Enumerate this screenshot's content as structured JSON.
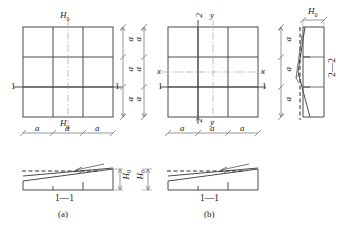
{
  "figure": {
    "title": "",
    "caption_a": "(a)",
    "caption_b": "(b)",
    "line_color": "#4a4a4a",
    "dash_color": "#2b2b2b",
    "center_color": "#9a9a9a"
  },
  "plan_a": {
    "name": "plan-view-a",
    "bays_x": 3,
    "bays_y": 3,
    "top_label": "H",
    "top_label_sub": "0",
    "bottom_label": "H",
    "bottom_label_sub": "0",
    "left_section_label": "1",
    "right_section_label": "1",
    "dim_bottom": [
      "a",
      "a",
      "a"
    ],
    "dim_right": [
      "a",
      "a",
      "a"
    ]
  },
  "plan_b": {
    "name": "plan-view-b",
    "bays_x": 3,
    "bays_y": 3,
    "top_labels": [
      "2",
      "y"
    ],
    "bottom_labels": [
      "2",
      "y"
    ],
    "left_labels": [
      "x",
      "1"
    ],
    "right_labels": [
      "x",
      "1"
    ],
    "dim_bottom": [
      "a",
      "a",
      "a"
    ],
    "dim_left": [
      "a",
      "a",
      "a"
    ]
  },
  "section_a": {
    "name": "section-1-1-a",
    "label": "1—1",
    "height_label": "H",
    "height_label_sub": "0",
    "panels": 3
  },
  "section_b": {
    "name": "section-1-1-b",
    "label": "1—1",
    "height_label": "H",
    "height_label_sub": "0",
    "panels": 3
  },
  "section_22": {
    "name": "section-2-2",
    "label": "2—2",
    "width_label": "H",
    "width_label_sub": "0",
    "panels": 3
  }
}
